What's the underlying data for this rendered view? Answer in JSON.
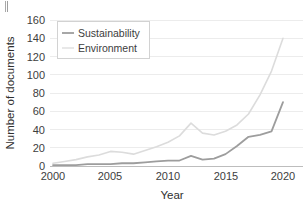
{
  "chart_data": {
    "type": "line",
    "title": "",
    "xlabel": "Year",
    "ylabel": "Number of documents",
    "xlim": [
      2000,
      2020
    ],
    "ylim": [
      0,
      160
    ],
    "grid": true,
    "legend_position": "top-left",
    "x_ticks": [
      "2000",
      "2005",
      "2010",
      "2015",
      "2020"
    ],
    "x_tick_values": [
      2000,
      2005,
      2010,
      2015,
      2020
    ],
    "y_ticks": [
      "0",
      "20",
      "40",
      "60",
      "80",
      "100",
      "120",
      "140",
      "160"
    ],
    "y_tick_values": [
      0,
      20,
      40,
      60,
      80,
      100,
      120,
      140,
      160
    ],
    "x": [
      2000,
      2001,
      2002,
      2003,
      2004,
      2005,
      2006,
      2007,
      2008,
      2009,
      2010,
      2011,
      2012,
      2013,
      2014,
      2015,
      2016,
      2017,
      2018,
      2019,
      2020
    ],
    "series": [
      {
        "name": "Sustainability",
        "color": "#9d9d9d",
        "values": [
          1,
          1,
          1,
          2,
          2,
          2,
          3,
          3,
          4,
          5,
          6,
          6,
          11,
          7,
          8,
          13,
          22,
          32,
          34,
          38,
          70
        ]
      },
      {
        "name": "Environment",
        "color": "#dcdcdc",
        "values": [
          3,
          5,
          7,
          10,
          12,
          16,
          15,
          13,
          17,
          21,
          26,
          33,
          47,
          36,
          34,
          38,
          45,
          57,
          78,
          104,
          140
        ]
      }
    ]
  },
  "legend": {
    "entries": [
      {
        "label": "Sustainability",
        "swatch": "line-swatch-sustainability"
      },
      {
        "label": "Environment",
        "swatch": "line-swatch-environment"
      }
    ]
  },
  "axes": {
    "x_title": "Year",
    "y_title": "Number of documents"
  }
}
